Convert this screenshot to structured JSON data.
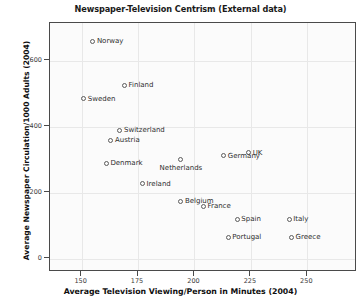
{
  "chart_data": {
    "type": "scatter",
    "title": "Newspaper-Television Centrism (External data)",
    "xlabel": "Average Television Viewing/Person in Minutes (2004)",
    "ylabel": "Average Newspaper Circulation/1000 Adults (2004)",
    "xlim": [
      136,
      272
    ],
    "ylim": [
      -40,
      715
    ],
    "xticks": [
      150,
      175,
      200,
      225,
      250
    ],
    "xtick_labels": [
      "150",
      "175",
      "200",
      "225",
      "250"
    ],
    "yticks": [
      0,
      200,
      400,
      600
    ],
    "ytick_labels": [
      "0",
      "200",
      "400",
      "600"
    ],
    "grid": true,
    "legend": "none",
    "marker": "open-circle",
    "marker_color": "#5c5c5c",
    "points": [
      {
        "label": "Norway",
        "x": 155,
        "y": 660,
        "label_pos": "right"
      },
      {
        "label": "Finland",
        "x": 169,
        "y": 527,
        "label_pos": "right"
      },
      {
        "label": "Sweden",
        "x": 151,
        "y": 485,
        "label_pos": "right"
      },
      {
        "label": "Switzerland",
        "x": 167,
        "y": 390,
        "label_pos": "right"
      },
      {
        "label": "Austria",
        "x": 163,
        "y": 360,
        "label_pos": "right"
      },
      {
        "label": "Denmark",
        "x": 161,
        "y": 290,
        "label_pos": "right"
      },
      {
        "label": "UK",
        "x": 224,
        "y": 322,
        "label_pos": "right"
      },
      {
        "label": "Germany",
        "x": 213,
        "y": 312,
        "label_pos": "right"
      },
      {
        "label": "Netherlands",
        "x": 194,
        "y": 302,
        "label_pos": "below"
      },
      {
        "label": "Ireland",
        "x": 177,
        "y": 228,
        "label_pos": "right"
      },
      {
        "label": "Belgium",
        "x": 194,
        "y": 175,
        "label_pos": "right"
      },
      {
        "label": "France",
        "x": 204,
        "y": 160,
        "label_pos": "right"
      },
      {
        "label": "Spain",
        "x": 219,
        "y": 120,
        "label_pos": "right"
      },
      {
        "label": "Italy",
        "x": 242,
        "y": 120,
        "label_pos": "right"
      },
      {
        "label": "Portugal",
        "x": 215,
        "y": 65,
        "label_pos": "right"
      },
      {
        "label": "Greece",
        "x": 243,
        "y": 65,
        "label_pos": "right"
      }
    ]
  }
}
